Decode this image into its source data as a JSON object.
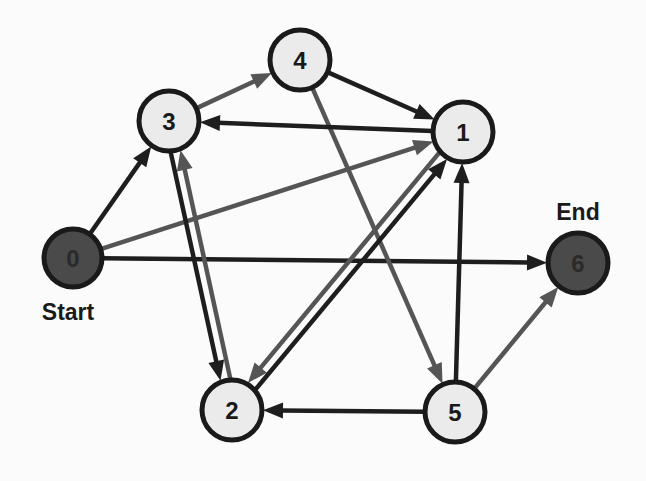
{
  "diagram": {
    "type": "directed-graph",
    "colors": {
      "background": "#fbfbfb",
      "node_fill": "#ebebeb",
      "node_fill_terminal": "#4a4a4a",
      "node_stroke": "#1a1a1a",
      "edge_dark": "#1e1e1e",
      "edge_gray": "#555555",
      "label_terminal": "#2a2a2a",
      "label_normal": "#1a1a1a"
    },
    "nodes": [
      {
        "id": "0",
        "label": "0",
        "x": 73,
        "y": 258,
        "r": 29,
        "terminal": true,
        "caption": "Start",
        "caption_x": 68,
        "caption_y": 320
      },
      {
        "id": "1",
        "label": "1",
        "x": 463,
        "y": 132,
        "r": 30,
        "terminal": false
      },
      {
        "id": "2",
        "label": "2",
        "x": 232,
        "y": 410,
        "r": 30,
        "terminal": false
      },
      {
        "id": "3",
        "label": "3",
        "x": 169,
        "y": 121,
        "r": 30,
        "terminal": false
      },
      {
        "id": "4",
        "label": "4",
        "x": 300,
        "y": 60,
        "r": 30,
        "terminal": false
      },
      {
        "id": "5",
        "label": "5",
        "x": 455,
        "y": 412,
        "r": 30,
        "terminal": false
      },
      {
        "id": "6",
        "label": "6",
        "x": 578,
        "y": 263,
        "r": 30,
        "terminal": true,
        "caption": "End",
        "caption_x": 578,
        "caption_y": 220
      }
    ],
    "edges": [
      {
        "from": "0",
        "to": "3",
        "color": "dark",
        "offset": 0
      },
      {
        "from": "0",
        "to": "1",
        "color": "gray",
        "offset": 0
      },
      {
        "from": "0",
        "to": "6",
        "color": "dark",
        "offset": 0
      },
      {
        "from": "3",
        "to": "4",
        "color": "gray",
        "offset": 0
      },
      {
        "from": "3",
        "to": "2",
        "color": "dark",
        "offset": 5
      },
      {
        "from": "2",
        "to": "3",
        "color": "gray",
        "offset": 5
      },
      {
        "from": "4",
        "to": "1",
        "color": "dark",
        "offset": 0
      },
      {
        "from": "4",
        "to": "5",
        "color": "gray",
        "offset": 0
      },
      {
        "from": "1",
        "to": "3",
        "color": "dark",
        "offset": 0
      },
      {
        "from": "1",
        "to": "2",
        "color": "gray",
        "offset": 5
      },
      {
        "from": "2",
        "to": "1",
        "color": "dark",
        "offset": 5
      },
      {
        "from": "5",
        "to": "1",
        "color": "dark",
        "offset": 0
      },
      {
        "from": "5",
        "to": "2",
        "color": "dark",
        "offset": 0
      },
      {
        "from": "5",
        "to": "6",
        "color": "gray",
        "offset": 0
      }
    ]
  }
}
